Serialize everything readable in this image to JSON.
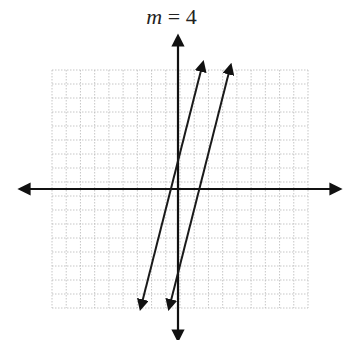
{
  "title": {
    "variable": "m",
    "equals": " = ",
    "value": "4"
  },
  "chart_data": {
    "type": "line",
    "title": "m = 4",
    "xlabel": "",
    "ylabel": "",
    "grid": true,
    "grid_cells_x": 18,
    "grid_cells_y": 17,
    "xlim": [
      -9,
      9
    ],
    "ylim": [
      -8.5,
      8.5
    ],
    "axes_arrows": true,
    "series": [
      {
        "name": "line-1",
        "slope": 4,
        "y_intercept": 2,
        "arrows_both_ends": true
      },
      {
        "name": "line-2",
        "slope": 4,
        "y_intercept": -6,
        "arrows_both_ends": true
      }
    ]
  },
  "colors": {
    "grid": "#b8b8b8",
    "axis": "#111111",
    "line": "#1a1a1a"
  }
}
